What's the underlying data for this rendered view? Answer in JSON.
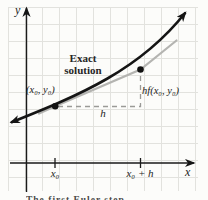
{
  "figure": {
    "axis_labels": {
      "y": "y",
      "x": "x"
    },
    "curve_label": "Exact\nsolution",
    "point_label": "(x₀, y₀)",
    "rise_label": "hf(x₀, y₀)",
    "run_label": "h",
    "tick_labels": {
      "x0": "x₀",
      "x0_plus_h": "x₀ + h"
    },
    "caption_fragment": "The first Euler step",
    "colors": {
      "background": "#fcfcfa",
      "grid": "#e2e2de",
      "axis": "#1a1a1a",
      "exact_curve": "#151515",
      "tangent_line": "#b4b4b1",
      "dashed_guides": "#9a9a97",
      "points": "#111111"
    }
  }
}
